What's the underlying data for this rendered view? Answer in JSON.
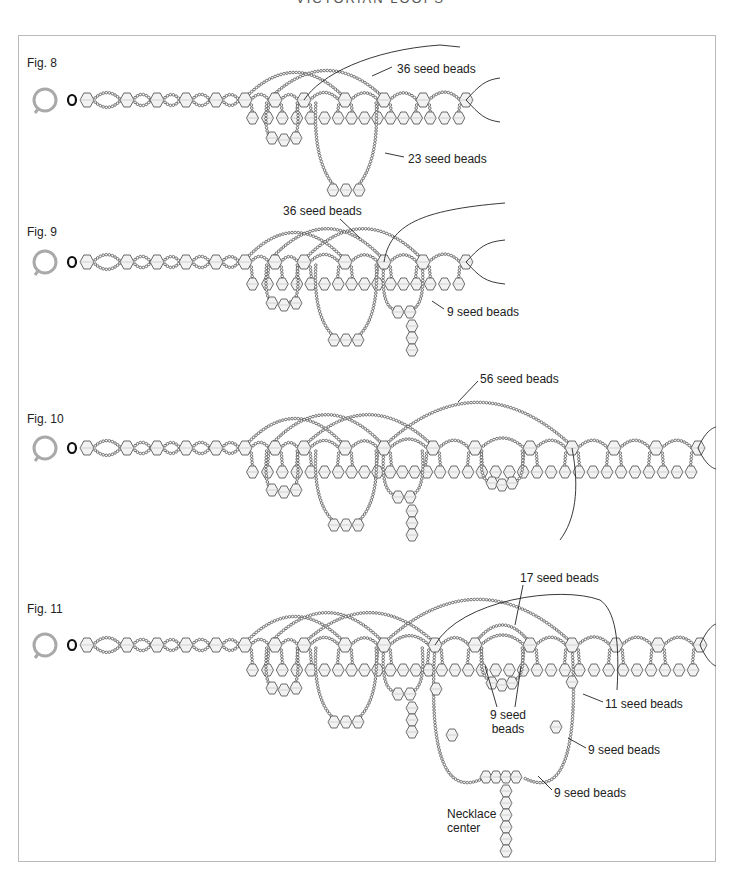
{
  "page": {
    "running_header": "VICTORIAN LOOPS"
  },
  "colors": {
    "frame": "#b9b9b9",
    "seed_bead": "#555555",
    "bicone_fill": "#f2f2f2",
    "bicone_stroke": "#444444",
    "ring": "#a9a9a9",
    "thread": "#222222"
  },
  "figures": [
    {
      "id": "fig8",
      "label": "Fig. 8",
      "label_pos": [
        27,
        56
      ],
      "chain_y": 100,
      "chain_x": [
        87,
        127,
        157,
        186,
        216,
        245,
        275,
        304,
        345,
        384,
        423,
        466
      ],
      "ring": [
        45,
        100
      ],
      "hanging_y": 118,
      "hanging_from": 5,
      "callouts": [
        {
          "text": "36 seed beads",
          "pos": [
            397,
            62
          ],
          "line": [
            [
              392,
              67
            ],
            [
              372,
              76
            ]
          ]
        },
        {
          "text": "23 seed beads",
          "pos": [
            408,
            152
          ],
          "line": [
            [
              404,
              157
            ],
            [
              385,
              153
            ]
          ]
        }
      ],
      "drops": [
        {
          "cx": 346,
          "top": 100,
          "bottom": 190,
          "w": 60,
          "bead_cluster": [
            [
              333,
              190
            ],
            [
              346,
              190
            ],
            [
              359,
              190
            ]
          ]
        },
        {
          "cx": 282,
          "top": 100,
          "bottom": 138,
          "w": 30,
          "bead_cluster": [
            [
              272,
              138
            ],
            [
              284,
              140
            ],
            [
              296,
              138
            ]
          ]
        }
      ],
      "arcs": [
        {
          "x1": 245,
          "x2": 345,
          "peak": 72
        },
        {
          "x1": 270,
          "x2": 384,
          "peak": 70
        }
      ],
      "threads": [
        {
          "d": "M 304 100 C 320 75, 370 50, 440 45 L 460 47"
        },
        {
          "d": "M 466 100 C 480 85, 485 80, 500 78"
        },
        {
          "d": "M 466 100 C 480 115, 485 120, 500 122"
        }
      ]
    },
    {
      "id": "fig9",
      "label": "Fig. 9",
      "label_pos": [
        27,
        225
      ],
      "chain_y": 262,
      "chain_x": [
        87,
        127,
        157,
        186,
        216,
        245,
        275,
        304,
        345,
        384,
        423,
        466
      ],
      "ring": [
        45,
        262
      ],
      "hanging_y": 284,
      "hanging_from": 5,
      "callouts": [
        {
          "text": "36 seed beads",
          "pos": [
            283,
            204
          ],
          "line": [
            [
              340,
              219
            ],
            [
              360,
              238
            ]
          ]
        },
        {
          "text": "9 seed beads",
          "pos": [
            447,
            305
          ],
          "line": [
            [
              444,
              309
            ],
            [
              432,
              301
            ]
          ]
        }
      ],
      "drops": [
        {
          "cx": 346,
          "top": 262,
          "bottom": 340,
          "w": 60,
          "bead_cluster": [
            [
              334,
              340
            ],
            [
              346,
              340
            ],
            [
              358,
              340
            ]
          ]
        },
        {
          "cx": 282,
          "top": 262,
          "bottom": 302,
          "w": 30,
          "bead_cluster": [
            [
              272,
              303
            ],
            [
              284,
              305
            ],
            [
              296,
              303
            ]
          ]
        },
        {
          "cx": 403,
          "top": 262,
          "bottom": 310,
          "w": 38,
          "bead_cluster": [
            [
              398,
              312
            ],
            [
              410,
              312
            ]
          ],
          "pendant": [
            [
              412,
              326
            ],
            [
              412,
              338
            ],
            [
              412,
              350
            ]
          ]
        }
      ],
      "arcs": [
        {
          "x1": 245,
          "x2": 345,
          "peak": 232
        },
        {
          "x1": 270,
          "x2": 384,
          "peak": 228
        },
        {
          "x1": 304,
          "x2": 423,
          "peak": 228
        }
      ],
      "threads": [
        {
          "d": "M 384 262 C 390 225, 420 210, 505 203"
        },
        {
          "d": "M 466 262 C 480 247, 485 242, 505 240"
        },
        {
          "d": "M 466 262 C 480 277, 485 282, 505 284"
        }
      ]
    },
    {
      "id": "fig10",
      "label": "Fig. 10",
      "label_pos": [
        27,
        412
      ],
      "chain_y": 448,
      "chain_x": [
        87,
        127,
        157,
        186,
        216,
        245,
        275,
        304,
        345,
        384,
        433,
        475,
        530,
        572,
        614,
        656,
        698
      ],
      "ring": [
        45,
        448
      ],
      "hanging_y": 472,
      "hanging_from": 5,
      "callouts": [
        {
          "text": "56 seed beads",
          "pos": [
            480,
            372
          ],
          "line": [
            [
              478,
              381
            ],
            [
              458,
              402
            ]
          ]
        }
      ],
      "drops": [
        {
          "cx": 346,
          "top": 448,
          "bottom": 525,
          "w": 60,
          "bead_cluster": [
            [
              334,
              525
            ],
            [
              346,
              525
            ],
            [
              358,
              525
            ]
          ]
        },
        {
          "cx": 282,
          "top": 448,
          "bottom": 490,
          "w": 30,
          "bead_cluster": [
            [
              272,
              490
            ],
            [
              284,
              492
            ],
            [
              296,
              490
            ]
          ]
        },
        {
          "cx": 403,
          "top": 448,
          "bottom": 495,
          "w": 38,
          "bead_cluster": [
            [
              398,
              497
            ],
            [
              410,
              497
            ]
          ],
          "pendant": [
            [
              412,
              511
            ],
            [
              412,
              523
            ],
            [
              412,
              535
            ]
          ]
        },
        {
          "cx": 502,
          "top": 448,
          "bottom": 482,
          "w": 40,
          "bead_cluster": [
            [
              492,
              483
            ],
            [
              502,
              485
            ],
            [
              512,
              483
            ]
          ]
        }
      ],
      "arcs": [
        {
          "x1": 245,
          "x2": 345,
          "peak": 418
        },
        {
          "x1": 270,
          "x2": 384,
          "peak": 414
        },
        {
          "x1": 304,
          "x2": 433,
          "peak": 414
        },
        {
          "x1": 384,
          "x2": 572,
          "peak": 401
        }
      ],
      "threads": [
        {
          "d": "M 572 448 C 580 490, 575 520, 560 540"
        },
        {
          "d": "M 698 448 C 705 432, 712 428, 716 427"
        },
        {
          "d": "M 698 448 C 705 464, 712 468, 716 469"
        }
      ]
    },
    {
      "id": "fig11",
      "label": "Fig. 11",
      "label_pos": [
        27,
        602
      ],
      "chain_y": 645,
      "chain_x": [
        87,
        127,
        157,
        186,
        216,
        245,
        275,
        304,
        345,
        384,
        435,
        475,
        530,
        572,
        616,
        658,
        700
      ],
      "ring": [
        45,
        645
      ],
      "hanging_y": 670,
      "hanging_from": 5,
      "callouts": [
        {
          "text": "17 seed beads",
          "pos": [
            520,
            571
          ],
          "line": [
            [
              523,
              585
            ],
            [
              515,
              625
            ]
          ]
        },
        {
          "text": "11 seed beads",
          "pos": [
            605,
            697
          ],
          "line": [
            [
              603,
              702
            ],
            [
              583,
              694
            ]
          ]
        },
        {
          "text": "9 seed beads (right)",
          "pos": [
            588,
            743
          ],
          "display": "9 seed beads",
          "line": [
            [
              586,
              748
            ],
            [
              568,
              738
            ]
          ]
        },
        {
          "text": "9 seed beads (lower)",
          "pos": [
            554,
            786
          ],
          "display": "9 seed beads",
          "line": [
            [
              552,
              790
            ],
            [
              538,
              776
            ]
          ]
        }
      ],
      "center_label": {
        "text_line1": "9 seed",
        "text_line2": "beads",
        "pos": [
          490,
          708
        ]
      },
      "necklace_center": {
        "line1": "Necklace",
        "line2": "center",
        "pos": [
          447,
          807
        ]
      },
      "drops": [
        {
          "cx": 346,
          "top": 645,
          "bottom": 722,
          "w": 60,
          "bead_cluster": [
            [
              334,
              722
            ],
            [
              346,
              722
            ],
            [
              358,
              722
            ]
          ]
        },
        {
          "cx": 282,
          "top": 645,
          "bottom": 688,
          "w": 30,
          "bead_cluster": [
            [
              272,
              688
            ],
            [
              284,
              690
            ],
            [
              296,
              688
            ]
          ]
        },
        {
          "cx": 403,
          "top": 645,
          "bottom": 692,
          "w": 38,
          "bead_cluster": [
            [
              398,
              694
            ],
            [
              410,
              694
            ]
          ],
          "pendant": [
            [
              412,
              708
            ],
            [
              412,
              720
            ],
            [
              412,
              732
            ]
          ]
        },
        {
          "cx": 502,
          "top": 645,
          "bottom": 680,
          "w": 40,
          "bead_cluster": [
            [
              492,
              683
            ],
            [
              502,
              685
            ],
            [
              512,
              683
            ]
          ]
        }
      ],
      "big_loop": {
        "left": 435,
        "right": 572,
        "top": 645,
        "bottom": 798,
        "cx": 504,
        "beads": [
          [
            436,
            689
          ],
          [
            452,
            735
          ],
          [
            486,
            777
          ],
          [
            496,
            777
          ],
          [
            506,
            777
          ],
          [
            516,
            777
          ],
          [
            556,
            727
          ],
          [
            572,
            682
          ]
        ],
        "pendant": [
          [
            506,
            791
          ],
          [
            506,
            803
          ],
          [
            506,
            815
          ],
          [
            506,
            827
          ],
          [
            506,
            839
          ],
          [
            506,
            851
          ]
        ]
      },
      "arcs": [
        {
          "x1": 245,
          "x2": 345,
          "peak": 616
        },
        {
          "x1": 270,
          "x2": 384,
          "peak": 612
        },
        {
          "x1": 304,
          "x2": 435,
          "peak": 612
        },
        {
          "x1": 384,
          "x2": 572,
          "peak": 598
        },
        {
          "x1": 475,
          "x2": 530,
          "peak": 625
        }
      ],
      "threads": [
        {
          "d": "M 435 645 C 460 600, 560 585, 600 600 C 615 610, 620 640, 617 690"
        },
        {
          "d": "M 700 645 C 707 629, 713 625, 716 624"
        },
        {
          "d": "M 700 645 C 707 661, 713 665, 716 666"
        }
      ]
    }
  ]
}
